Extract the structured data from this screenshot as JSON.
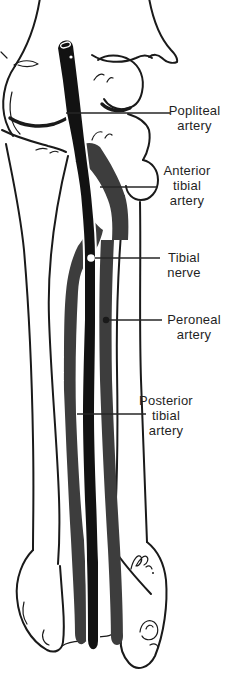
{
  "figure_type": "anatomical line diagram of the leg (knee to ankle) showing vessels and nerve",
  "colors": {
    "background": "#ffffff",
    "outline_ink": "#1a1a1a",
    "artery_black": "#121212",
    "gray_band": "#3d3d3d",
    "label_text": "#1f1f1f"
  },
  "labels": {
    "popliteal": {
      "text": "Popliteal\nartery"
    },
    "anterior_tibial": {
      "text": "Anterior\ntibial\nartery"
    },
    "tibial_nerve": {
      "text": "Tibial\nnerve"
    },
    "peroneal": {
      "text": "Peroneal\nartery"
    },
    "posterior_tibial": {
      "text": "Posterior\ntibial\nartery"
    }
  }
}
